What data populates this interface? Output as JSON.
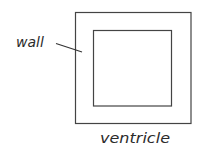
{
  "diagram": {
    "labels": {
      "wall": "wall",
      "ventricle": "ventricle"
    },
    "colors": {
      "stroke": "#444444",
      "text": "#2b2b2b",
      "background": "#ffffff"
    },
    "shapes": {
      "outer_square": {
        "x": 75,
        "y": 12,
        "width": 116,
        "height": 111
      },
      "inner_square": {
        "x": 93.5,
        "y": 30.5,
        "width": 78,
        "height": 75.5
      }
    }
  }
}
